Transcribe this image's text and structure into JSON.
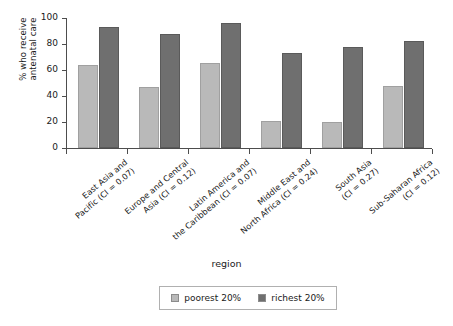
{
  "chart_data": {
    "type": "bar",
    "title": "",
    "xlabel": "region",
    "ylabel_line1": "% who receive",
    "ylabel_line2": "antenatal care",
    "ylim": [
      0,
      100
    ],
    "yticks": [
      "0",
      "20",
      "40",
      "60",
      "80",
      "100"
    ],
    "grid": false,
    "legend_position": "bottom",
    "categories": [
      "East Asia and\nPacific (CI = 0.07)",
      "Europe and Central\nAsia (CI = 0.12)",
      "Latin America and\nthe Caribbean (CI = 0.07)",
      "Middle East and\nNorth Africa (CI = 0.24)",
      "South Asia\n(CI = 0.27)",
      "Sub-Saharan Africa\n(CI = 0.12)"
    ],
    "categories_lines": [
      [
        "East Asia and",
        "Pacific (CI = 0.07)"
      ],
      [
        "Europe and Central",
        "Asia (CI = 0.12)"
      ],
      [
        "Latin America and",
        "the Caribbean (CI = 0.07)"
      ],
      [
        "Middle East and",
        "North Africa (CI = 0.24)"
      ],
      [
        "South Asia",
        "(CI = 0.27)"
      ],
      [
        "Sub-Saharan Africa",
        "(CI = 0.12)"
      ]
    ],
    "series": [
      {
        "name": "poorest 20%",
        "color": "#b9b9b9",
        "values": [
          64,
          47,
          65,
          21,
          20,
          48
        ]
      },
      {
        "name": "richest 20%",
        "color": "#6f6f6f",
        "values": [
          93,
          88,
          96,
          73,
          78,
          82
        ]
      }
    ]
  },
  "legend": {
    "entries": [
      {
        "label": "poorest 20%",
        "swatch": "poorest"
      },
      {
        "label": "richest 20%",
        "swatch": "richest"
      }
    ]
  }
}
